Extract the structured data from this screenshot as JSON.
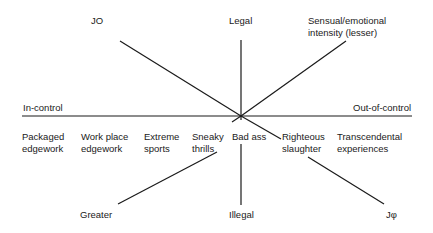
{
  "diagram": {
    "top_left_label": "JO",
    "top_center_label": "Legal",
    "top_right_label": "Sensual/emotional\nintensity (lesser)",
    "left_axis_label": "In-control",
    "right_axis_label": "Out-of-control",
    "bottom_left_label": "Greater",
    "bottom_center_label": "Illegal",
    "bottom_right_label": "Jφ",
    "categories": [
      {
        "label": "Packaged\nedgework"
      },
      {
        "label": "Work place\nedgework"
      },
      {
        "label": "Extreme\nsports"
      },
      {
        "label": "Sneaky\nthrills"
      },
      {
        "label": "Bad ass"
      },
      {
        "label": "Righteous\nslaughter"
      },
      {
        "label": "Transcendental\nexperiences"
      }
    ],
    "line_color": "#1a1a1a"
  }
}
